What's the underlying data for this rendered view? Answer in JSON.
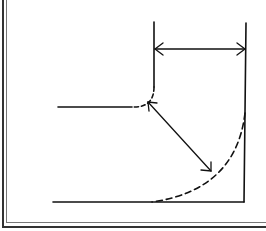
{
  "diagram": {
    "colors": {
      "line": "#111111",
      "background": "#ffffff",
      "frame": "#333333"
    },
    "labels": []
  }
}
